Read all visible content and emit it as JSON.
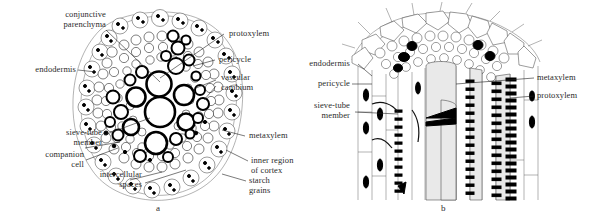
{
  "figure": {
    "panels": [
      {
        "letter": "a",
        "name": "root-cross-section",
        "labels": [
          {
            "id": "conjunctive-parenchyma",
            "text": "conjunctive\nparenchyma"
          },
          {
            "id": "endodermis",
            "text": "endodermis"
          },
          {
            "id": "protoxylem",
            "text": "protoxylem"
          },
          {
            "id": "pericycle",
            "text": "pericycle"
          },
          {
            "id": "vascular-cambium",
            "text": "vascular\ncambium"
          },
          {
            "id": "sieve-tube-member",
            "text": "sieve-tube\nmember"
          },
          {
            "id": "companion-cell",
            "text": "companion\ncell"
          },
          {
            "id": "intercellular-spaces",
            "text": "intercellular\nspaces"
          },
          {
            "id": "metaxylem",
            "text": "metaxylem"
          },
          {
            "id": "inner-region-of-cortex",
            "text": "inner region\nof cortex"
          },
          {
            "id": "starch-grains",
            "text": "starch\ngrains"
          }
        ]
      },
      {
        "letter": "b",
        "name": "root-longitudinal-section",
        "labels": [
          {
            "id": "endodermis",
            "text": "endodermis"
          },
          {
            "id": "pericycle",
            "text": "pericycle"
          },
          {
            "id": "sieve-tube-member",
            "text": "sieve-tube\nmember"
          },
          {
            "id": "metaxylem",
            "text": "metaxylem"
          },
          {
            "id": "protoxylem",
            "text": "protoxylem"
          }
        ]
      }
    ]
  },
  "colors": {
    "background": "#ffffff",
    "ink": "#111111",
    "text": "#2b2b2b",
    "leader": "#222222"
  }
}
